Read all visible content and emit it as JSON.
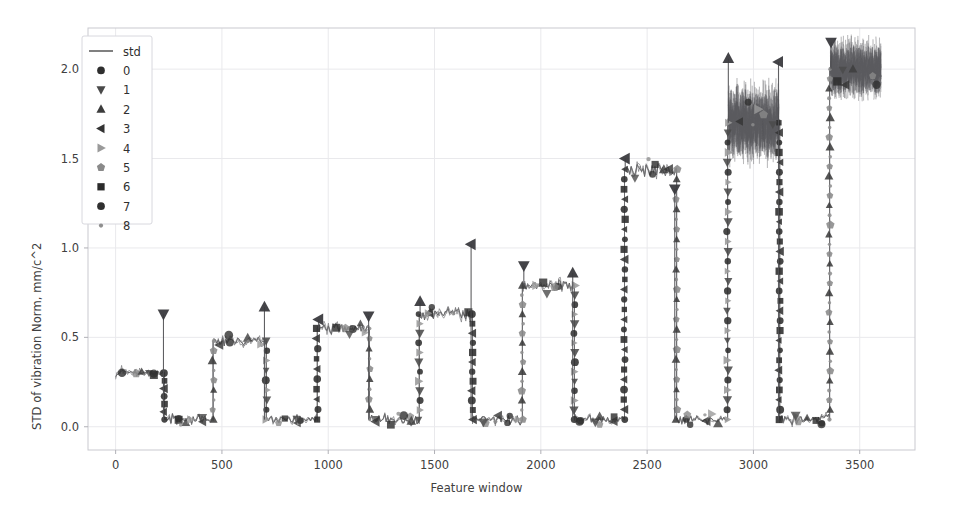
{
  "chart_data": {
    "type": "line",
    "title": "",
    "xlabel": "Feature window",
    "ylabel": "STD of vibration Norm, mm/c^2",
    "xlim": [
      -130,
      3760
    ],
    "ylim": [
      -0.13,
      2.23
    ],
    "xticks": [
      0,
      500,
      1000,
      1500,
      2000,
      2500,
      3000,
      3500
    ],
    "xticklabels": [
      "0",
      "500",
      "1000",
      "1500",
      "2000",
      "2500",
      "3000",
      "3500"
    ],
    "yticks": [
      0.0,
      0.5,
      1.0,
      1.5,
      2.0
    ],
    "yticklabels": [
      "0.0",
      "0.5",
      "1.0",
      "1.5",
      "2.0"
    ],
    "grid": true,
    "legend_position": "upper left",
    "legend_entries": [
      {
        "label": "std",
        "marker": "line",
        "color": "#4a4a4a"
      },
      {
        "label": "0",
        "marker": "circle",
        "color": "#2e2e2e"
      },
      {
        "label": "1",
        "marker": "triangle-down",
        "color": "#4a4a4a"
      },
      {
        "label": "2",
        "marker": "triangle-up",
        "color": "#3c3c3c"
      },
      {
        "label": "3",
        "marker": "triangle-left",
        "color": "#333333"
      },
      {
        "label": "4",
        "marker": "triangle-right",
        "color": "#9a9a9a"
      },
      {
        "label": "5",
        "marker": "pentagon",
        "color": "#8a8a8a"
      },
      {
        "label": "6",
        "marker": "square",
        "color": "#2b2b2b"
      },
      {
        "label": "7",
        "marker": "circle",
        "color": "#303030"
      },
      {
        "label": "8",
        "marker": "dot",
        "color": "#8f8f8f"
      }
    ],
    "segments": [
      {
        "index": 0,
        "x_start": 0,
        "x_end": 225,
        "plateau": 0.3,
        "noise": 0.015,
        "low": false
      },
      {
        "index": 1,
        "x_start": 232,
        "x_end": 455,
        "plateau": 0.04,
        "noise": 0.022,
        "low": true
      },
      {
        "index": 2,
        "x_start": 462,
        "x_end": 705,
        "plateau": 0.48,
        "noise": 0.022,
        "low": false
      },
      {
        "index": 3,
        "x_start": 712,
        "x_end": 945,
        "plateau": 0.04,
        "noise": 0.022,
        "low": true
      },
      {
        "index": 4,
        "x_start": 952,
        "x_end": 1190,
        "plateau": 0.55,
        "noise": 0.022,
        "low": false
      },
      {
        "index": 5,
        "x_start": 1197,
        "x_end": 1425,
        "plateau": 0.04,
        "noise": 0.022,
        "low": true
      },
      {
        "index": 6,
        "x_start": 1432,
        "x_end": 1675,
        "plateau": 0.63,
        "noise": 0.035,
        "low": false
      },
      {
        "index": 7,
        "x_start": 1682,
        "x_end": 1910,
        "plateau": 0.04,
        "noise": 0.022,
        "low": true
      },
      {
        "index": 8,
        "x_start": 1917,
        "x_end": 2155,
        "plateau": 0.79,
        "noise": 0.025,
        "low": false
      },
      {
        "index": 9,
        "x_start": 2162,
        "x_end": 2390,
        "plateau": 0.04,
        "noise": 0.022,
        "low": true
      },
      {
        "index": 10,
        "x_start": 2397,
        "x_end": 2635,
        "plateau": 1.44,
        "noise": 0.03,
        "low": false
      },
      {
        "index": 11,
        "x_start": 2642,
        "x_end": 2875,
        "plateau": 0.04,
        "noise": 0.022,
        "low": true
      },
      {
        "index": 12,
        "x_start": 2882,
        "x_end": 3120,
        "plateau": 1.7,
        "noise": 0.11,
        "low": false
      },
      {
        "index": 13,
        "x_start": 3127,
        "x_end": 3355,
        "plateau": 0.04,
        "noise": 0.022,
        "low": true
      },
      {
        "index": 14,
        "x_start": 3362,
        "x_end": 3600,
        "plateau": 2.0,
        "noise": 0.085,
        "low": false
      }
    ],
    "transition_markers": [
      0.04,
      0.12,
      0.2,
      0.28,
      0.36,
      0.45,
      0.52,
      0.6,
      0.7,
      0.8,
      0.92,
      1.05
    ],
    "spike_peaks": [
      {
        "x": 225,
        "y": 0.63
      },
      {
        "x": 700,
        "y": 0.67
      },
      {
        "x": 955,
        "y": 0.6
      },
      {
        "x": 1190,
        "y": 0.62
      },
      {
        "x": 1432,
        "y": 0.7
      },
      {
        "x": 1672,
        "y": 1.02
      },
      {
        "x": 1920,
        "y": 0.9
      },
      {
        "x": 2150,
        "y": 0.86
      },
      {
        "x": 2397,
        "y": 1.5
      },
      {
        "x": 2630,
        "y": 1.33
      },
      {
        "x": 2882,
        "y": 2.06
      },
      {
        "x": 3118,
        "y": 2.04
      },
      {
        "x": 3365,
        "y": 2.15
      }
    ]
  }
}
